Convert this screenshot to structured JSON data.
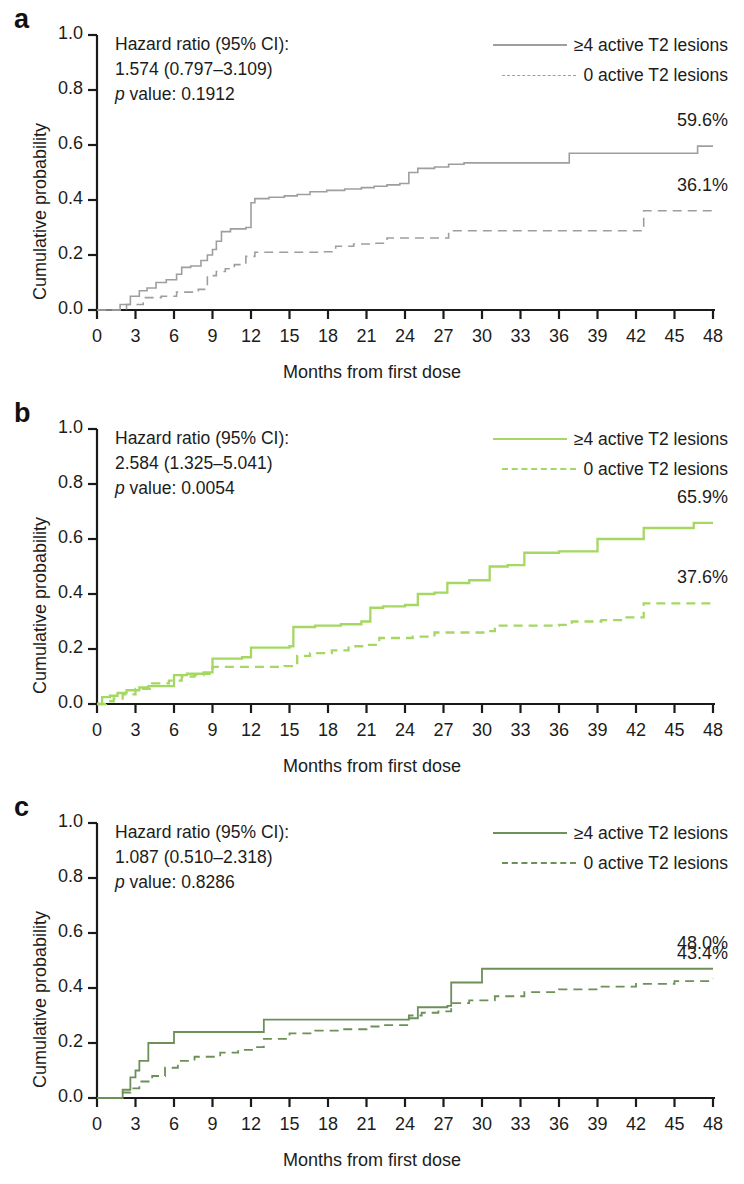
{
  "figure": {
    "axis": {
      "xlabel": "Months from first dose",
      "ylabel": "Cumulative probability",
      "xticks": [
        "0",
        "3",
        "6",
        "9",
        "12",
        "15",
        "18",
        "21",
        "24",
        "27",
        "30",
        "33",
        "36",
        "39",
        "42",
        "45",
        "48"
      ],
      "yticks": [
        "1.0",
        "0.8",
        "0.6",
        "0.4",
        "0.2",
        "0.0"
      ],
      "xlim": [
        0,
        48
      ],
      "ylim": [
        0,
        1
      ]
    },
    "legend": {
      "series_high_label": "≥4 active T2 lesions",
      "series_zero_label": "0 active T2 lesions"
    },
    "panels": [
      {
        "letter": "a",
        "color": "#9e9e9e",
        "hr_title": "Hazard ratio (95% CI):",
        "hr_value": "1.574 (0.797–3.109)",
        "p_prefix": "p",
        "p_text": " value: 0.1912",
        "end_high": "59.6%",
        "end_zero": "36.1%"
      },
      {
        "letter": "b",
        "color": "#a5d862",
        "hr_title": "Hazard ratio (95% CI):",
        "hr_value": "2.584 (1.325–5.041)",
        "p_prefix": "p",
        "p_text": " value: 0.0054",
        "end_high": "65.9%",
        "end_zero": "37.6%"
      },
      {
        "letter": "c",
        "color": "#6d8f58",
        "hr_title": "Hazard ratio (95% CI):",
        "hr_value": "1.087 (0.510–2.318)",
        "p_prefix": "p",
        "p_text": " value: 0.8286",
        "end_high": "48.0%",
        "end_zero": "43.4%"
      }
    ]
  },
  "chart_data": [
    {
      "type": "line",
      "subtype": "kaplan-meier-step",
      "panel": "a",
      "title": "",
      "xlabel": "Months from first dose",
      "ylabel": "Cumulative probability",
      "xlim": [
        0,
        48
      ],
      "ylim": [
        0,
        1
      ],
      "grid": false,
      "legend_position": "top-right",
      "hazard_ratio": 1.574,
      "ci_low": 0.797,
      "ci_high": 3.109,
      "p_value": 0.1912,
      "series": [
        {
          "name": "≥4 active T2 lesions",
          "style": "solid",
          "color": "#9e9e9e",
          "final_label": "59.6%",
          "x": [
            0,
            1.3,
            1.8,
            2.6,
            3.3,
            3.9,
            4.6,
            5.4,
            6.2,
            6.6,
            7.3,
            8.1,
            8.6,
            9.0,
            9.3,
            9.7,
            10.4,
            11.6,
            12.0,
            12.3,
            13.4,
            14.6,
            15.6,
            16.6,
            17.9,
            19.3,
            20.6,
            21.6,
            22.6,
            23.6,
            24.3,
            25.0,
            26.3,
            27.4,
            28.6,
            36.8,
            46.8,
            48
          ],
          "y": [
            0,
            0.0,
            0.02,
            0.05,
            0.07,
            0.08,
            0.1,
            0.11,
            0.13,
            0.155,
            0.16,
            0.18,
            0.2,
            0.22,
            0.25,
            0.285,
            0.295,
            0.3,
            0.39,
            0.405,
            0.41,
            0.415,
            0.42,
            0.43,
            0.435,
            0.44,
            0.445,
            0.45,
            0.455,
            0.46,
            0.5,
            0.515,
            0.52,
            0.53,
            0.535,
            0.57,
            0.596,
            0.596
          ]
        },
        {
          "name": "0 active T2 lesions",
          "style": "dashed",
          "color": "#9e9e9e",
          "final_label": "36.1%",
          "x": [
            0,
            1.6,
            2.3,
            3.6,
            5.0,
            6.2,
            7.9,
            8.6,
            9.3,
            10.0,
            10.7,
            11.6,
            12.3,
            17.5,
            18.6,
            20.0,
            21.6,
            22.6,
            27.4,
            42.6,
            48
          ],
          "y": [
            0,
            0.0,
            0.02,
            0.045,
            0.05,
            0.065,
            0.075,
            0.125,
            0.14,
            0.15,
            0.165,
            0.195,
            0.21,
            0.212,
            0.232,
            0.24,
            0.243,
            0.262,
            0.288,
            0.361,
            0.361
          ]
        }
      ]
    },
    {
      "type": "line",
      "subtype": "kaplan-meier-step",
      "panel": "b",
      "title": "",
      "xlabel": "Months from first dose",
      "ylabel": "Cumulative probability",
      "xlim": [
        0,
        48
      ],
      "ylim": [
        0,
        1
      ],
      "grid": false,
      "legend_position": "top-right",
      "hazard_ratio": 2.584,
      "ci_low": 1.325,
      "ci_high": 5.041,
      "p_value": 0.0054,
      "series": [
        {
          "name": "≥4 active T2 lesions",
          "style": "solid",
          "color": "#a5d862",
          "final_label": "65.9%",
          "x": [
            0,
            0.4,
            1.0,
            1.6,
            2.3,
            3.3,
            4.0,
            6.0,
            7.0,
            8.3,
            9.0,
            11.3,
            12.0,
            15.0,
            15.3,
            17.0,
            19.0,
            20.6,
            21.3,
            22.3,
            24.0,
            25.0,
            26.3,
            27.3,
            29.0,
            30.6,
            32.0,
            33.3,
            36.0,
            39.0,
            42.6,
            46.5,
            48
          ],
          "y": [
            0,
            0.025,
            0.03,
            0.04,
            0.05,
            0.06,
            0.065,
            0.105,
            0.11,
            0.115,
            0.165,
            0.17,
            0.205,
            0.21,
            0.28,
            0.285,
            0.29,
            0.3,
            0.35,
            0.355,
            0.36,
            0.4,
            0.405,
            0.44,
            0.45,
            0.5,
            0.505,
            0.55,
            0.555,
            0.6,
            0.64,
            0.659,
            0.659
          ]
        },
        {
          "name": "0 active T2 lesions",
          "style": "dashed",
          "color": "#a5d862",
          "final_label": "37.6%",
          "x": [
            0,
            0.7,
            1.3,
            2.0,
            3.0,
            4.3,
            5.6,
            6.6,
            7.6,
            8.3,
            9.0,
            14.6,
            15.6,
            16.6,
            18.3,
            19.6,
            21.0,
            22.0,
            24.6,
            26.3,
            30.3,
            31.0,
            36.0,
            37.0,
            39.3,
            41.0,
            42.6,
            48
          ],
          "y": [
            0,
            0.01,
            0.02,
            0.035,
            0.055,
            0.075,
            0.085,
            0.1,
            0.105,
            0.11,
            0.135,
            0.138,
            0.175,
            0.185,
            0.195,
            0.21,
            0.215,
            0.24,
            0.245,
            0.26,
            0.265,
            0.285,
            0.288,
            0.3,
            0.305,
            0.315,
            0.366,
            0.366
          ]
        }
      ]
    },
    {
      "type": "line",
      "subtype": "kaplan-meier-step",
      "panel": "c",
      "title": "",
      "xlabel": "Months from first dose",
      "ylabel": "Cumulative probability",
      "xlim": [
        0,
        48
      ],
      "ylim": [
        0,
        1
      ],
      "grid": false,
      "legend_position": "top-right",
      "hazard_ratio": 1.087,
      "ci_low": 0.51,
      "ci_high": 2.318,
      "p_value": 0.8286,
      "series": [
        {
          "name": "≥4 active T2 lesions",
          "style": "solid",
          "color": "#6d8f58",
          "final_label": "48.0%",
          "x": [
            0,
            1.6,
            2.0,
            2.6,
            3.0,
            3.3,
            4.0,
            6.0,
            13.0,
            24.3,
            25.0,
            27.3,
            27.6,
            30.0,
            48
          ],
          "y": [
            0,
            0.0,
            0.03,
            0.075,
            0.1,
            0.135,
            0.2,
            0.24,
            0.285,
            0.29,
            0.33,
            0.335,
            0.42,
            0.47,
            0.47
          ]
        },
        {
          "name": "0 active T2 lesions",
          "style": "dashed",
          "color": "#6d8f58",
          "final_label": "43.4%",
          "x": [
            0,
            1.6,
            2.0,
            2.6,
            3.3,
            4.3,
            5.3,
            6.3,
            7.6,
            9.6,
            11.0,
            12.3,
            13.0,
            15.0,
            17.0,
            19.0,
            21.0,
            22.3,
            24.3,
            25.3,
            26.6,
            27.6,
            29.0,
            31.0,
            33.3,
            36.0,
            39.0,
            42.0,
            45.0,
            48
          ],
          "y": [
            0,
            0.0,
            0.02,
            0.035,
            0.06,
            0.08,
            0.11,
            0.135,
            0.15,
            0.165,
            0.175,
            0.185,
            0.215,
            0.235,
            0.245,
            0.25,
            0.26,
            0.265,
            0.3,
            0.31,
            0.315,
            0.345,
            0.355,
            0.37,
            0.385,
            0.395,
            0.405,
            0.415,
            0.425,
            0.434
          ]
        }
      ]
    }
  ]
}
